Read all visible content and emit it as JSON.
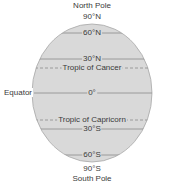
{
  "diagram": {
    "colors": {
      "globe_fill": "#d9d9d9",
      "globe_stroke": "#9a9a9a",
      "line": "#8a8a8a",
      "text": "#3a3a3a"
    },
    "labels": {
      "north_pole": "North Pole",
      "n90": "90°N",
      "n60": "60°N",
      "n30": "30°N",
      "tropic_cancer": "Tropic of Cancer",
      "equator": "Equator",
      "zero": "0°",
      "tropic_capricorn": "Tropic of Capricorn",
      "s30": "30°S",
      "s60": "60°S",
      "s90": "90°S",
      "south_pole": "South Pole"
    },
    "lines": [
      {
        "name": "60N",
        "y": 33,
        "style": "solid"
      },
      {
        "name": "30N",
        "y": 59,
        "style": "solid"
      },
      {
        "name": "tropic-of-cancer",
        "y": 68,
        "style": "dashed"
      },
      {
        "name": "equator",
        "y": 93,
        "style": "solid"
      },
      {
        "name": "tropic-of-capricorn",
        "y": 120,
        "style": "dashed"
      },
      {
        "name": "30S",
        "y": 129,
        "style": "solid"
      },
      {
        "name": "60S",
        "y": 155,
        "style": "solid"
      }
    ]
  }
}
